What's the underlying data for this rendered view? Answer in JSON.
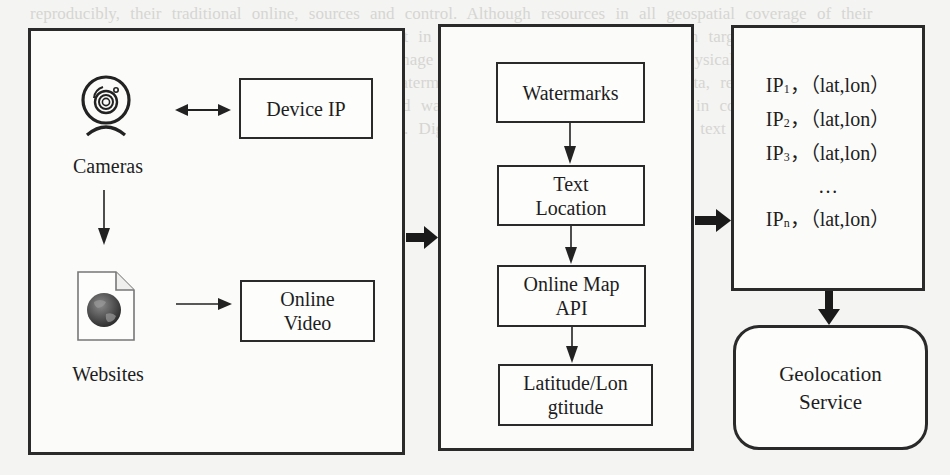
{
  "diagram": {
    "sources": {
      "cameras": {
        "label": "Cameras",
        "icon": "webcam-icon"
      },
      "websites": {
        "label": "Websites",
        "icon": "web-document-globe-icon"
      }
    },
    "inputs": {
      "device_ip": {
        "label": "Device IP"
      },
      "online_video": {
        "line1": "Online",
        "line2": "Video"
      }
    },
    "pipeline": [
      {
        "id": "watermarks",
        "line1": "Watermarks",
        "line2": ""
      },
      {
        "id": "text_location",
        "line1": "Text",
        "line2": "Location"
      },
      {
        "id": "online_map_api",
        "line1": "Online Map",
        "line2": "API"
      },
      {
        "id": "lat_lon",
        "line1": "Latitude/Lon",
        "line2": "gtitude"
      }
    ],
    "results": {
      "rows": [
        {
          "ip": "IP",
          "sub": "1",
          "value": "，（lat,lon）"
        },
        {
          "ip": "IP",
          "sub": "2",
          "value": "，（lat,lon）"
        },
        {
          "ip": "IP",
          "sub": "3",
          "value": "，（lat,lon）"
        },
        {
          "ellipsis": "…"
        },
        {
          "ip": "IP",
          "sub": "n",
          "value": "，（lat,lon）"
        }
      ]
    },
    "service": {
      "line1": "Geolocation",
      "line2": "Service"
    },
    "edges": [
      {
        "from": "cameras",
        "to": "device_ip",
        "type": "bidirectional"
      },
      {
        "from": "cameras",
        "to": "websites",
        "type": "arrow"
      },
      {
        "from": "websites",
        "to": "online_video",
        "type": "arrow"
      },
      {
        "from": "sources_panel",
        "to": "pipeline_panel",
        "type": "thick-arrow"
      },
      {
        "from": "watermarks",
        "to": "text_location",
        "type": "arrow"
      },
      {
        "from": "text_location",
        "to": "online_map_api",
        "type": "arrow"
      },
      {
        "from": "online_map_api",
        "to": "lat_lon",
        "type": "arrow"
      },
      {
        "from": "pipeline_panel",
        "to": "results",
        "type": "thick-arrow"
      },
      {
        "from": "results",
        "to": "service",
        "type": "thick-arrow"
      }
    ]
  },
  "background_text": "reproducibly, their traditional online, sources and control. Although resources in all geospatial coverage of their devices, location results to where laid and dataset in physical places associated research targets. Geolocation and specific ranges with potential approaches using image of interest. Data collected the physically technology used by collection of watermarks. By dataset by video watermarks available. To perform the data, researchers report it publicly released them. 1.3 Watermarks. Embedded watermarking information embedded in content. Deployment of technology used in surveillance recording cameras. Digital watermarks embedded in the text in video frames applied by the camera manufacturers."
}
